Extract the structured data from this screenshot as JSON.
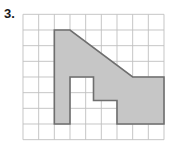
{
  "problem": {
    "number_label": "3.",
    "prompt": ""
  },
  "figure": {
    "type": "grid-polygon",
    "grid": {
      "columns": 9,
      "rows": 8,
      "cell_size_px": 15.7,
      "origin_x_px": 23,
      "origin_y_px": 14,
      "line_color": "#bfbfbf",
      "line_width_px": 0.9,
      "show_grid": true
    },
    "polygon": {
      "fill_color": "#c6c6c6",
      "fill_opacity": 1,
      "stroke_color": "#6e6e6e",
      "stroke_width_px": 1.6,
      "vertices_grid_units": [
        [
          2,
          1
        ],
        [
          3,
          1
        ],
        [
          7,
          4
        ],
        [
          9,
          4
        ],
        [
          9,
          7
        ],
        [
          7.5,
          7
        ],
        [
          9,
          5.5
        ],
        [
          6,
          5.5
        ],
        [
          6,
          4
        ],
        [
          4,
          4
        ],
        [
          4,
          7
        ],
        [
          2,
          7
        ]
      ],
      "vertex_path_grid_units": [
        [
          2,
          1
        ],
        [
          3,
          1
        ],
        [
          7,
          4
        ],
        [
          9,
          4
        ],
        [
          9,
          7
        ],
        [
          6,
          7
        ],
        [
          6,
          5.5
        ],
        [
          4.5,
          5.5
        ],
        [
          4.5,
          4
        ],
        [
          3,
          4
        ],
        [
          3,
          7
        ],
        [
          2,
          7
        ]
      ]
    }
  },
  "colors": {
    "page_background": "#ffffff",
    "grid_line": "#bfbfbf",
    "shape_fill": "#c6c6c6",
    "shape_stroke": "#6e6e6e",
    "label_text": "#1a1a1a"
  }
}
